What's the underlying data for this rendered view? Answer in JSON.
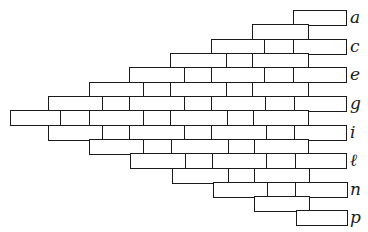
{
  "diagram": {
    "type": "brick-bond-triangle",
    "stroke_color": "#1a1a1a",
    "background": "#ffffff",
    "row_height": 14.3,
    "rows": [
      {
        "y": 10,
        "label": "a",
        "start": 293,
        "end": 345,
        "joints": []
      },
      {
        "y": 24,
        "label": "",
        "start": 252,
        "end": 307,
        "joints": []
      },
      {
        "y": 39,
        "label": "c",
        "start": 211,
        "end": 345,
        "joints": [
          264,
          293
        ]
      },
      {
        "y": 53,
        "label": "",
        "start": 170,
        "end": 307,
        "joints": [
          226,
          252
        ]
      },
      {
        "y": 67,
        "label": "e",
        "start": 129,
        "end": 345,
        "joints": [
          184,
          211,
          264,
          293
        ]
      },
      {
        "y": 82,
        "label": "",
        "start": 89,
        "end": 307,
        "joints": [
          143,
          170,
          226,
          252
        ]
      },
      {
        "y": 96,
        "label": "g",
        "start": 48,
        "end": 345,
        "joints": [
          102,
          129,
          184,
          211,
          265,
          294
        ]
      },
      {
        "y": 110,
        "label": "",
        "start": 10,
        "end": 307,
        "joints": [
          60,
          89,
          143,
          170,
          227,
          253
        ]
      },
      {
        "y": 125,
        "label": "i",
        "start": 48,
        "end": 345,
        "joints": [
          102,
          129,
          184,
          211,
          266,
          294
        ]
      },
      {
        "y": 139,
        "label": "",
        "start": 89,
        "end": 307,
        "joints": [
          143,
          171,
          228,
          254
        ]
      },
      {
        "y": 153,
        "label": "ℓ",
        "start": 130,
        "end": 345,
        "joints": [
          185,
          212,
          266,
          295
        ]
      },
      {
        "y": 168,
        "label": "",
        "start": 172,
        "end": 308,
        "joints": [
          228,
          254
        ]
      },
      {
        "y": 182,
        "label": "n",
        "start": 213,
        "end": 346,
        "joints": [
          267,
          295
        ]
      },
      {
        "y": 196,
        "label": "",
        "start": 254,
        "end": 308,
        "joints": []
      },
      {
        "y": 210,
        "label": "p",
        "start": 296,
        "end": 346,
        "joints": []
      }
    ],
    "labels": [
      "a",
      "c",
      "e",
      "g",
      "i",
      "ℓ",
      "n",
      "p"
    ],
    "label_x": 350
  }
}
